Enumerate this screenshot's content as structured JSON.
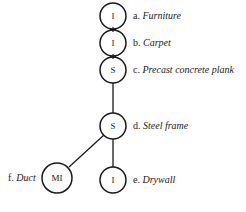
{
  "diagram": {
    "nodes": [
      {
        "id": "a",
        "symbol": "I",
        "prefix": "a.",
        "name": "Furniture"
      },
      {
        "id": "b",
        "symbol": "I",
        "prefix": "b.",
        "name": "Carpet"
      },
      {
        "id": "c",
        "symbol": "S",
        "prefix": "c.",
        "name": "Precast concrete plank"
      },
      {
        "id": "d",
        "symbol": "S",
        "prefix": "d.",
        "name": "Steel frame"
      },
      {
        "id": "e",
        "symbol": "I",
        "prefix": "e.",
        "name": "Drywall"
      },
      {
        "id": "f",
        "symbol": "MI",
        "prefix": "f.",
        "name": "Duct"
      }
    ],
    "edges": [
      {
        "from": "a",
        "to": "b"
      },
      {
        "from": "b",
        "to": "c"
      },
      {
        "from": "c",
        "to": "d"
      },
      {
        "from": "d",
        "to": "e"
      },
      {
        "from": "d",
        "to": "f"
      }
    ],
    "colors": {
      "stroke": "#1a1a1a",
      "background": "#ffffff"
    }
  }
}
